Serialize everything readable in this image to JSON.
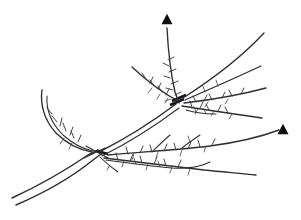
{
  "figure": {
    "title": "Thorny branch line drawing",
    "background_color": "#ffffff",
    "ink_color": "#2f2f33",
    "marker_color": "#0d0d10",
    "width": 301,
    "height": 220
  },
  "markers": [
    {
      "name": "upper-arrowhead",
      "label": "",
      "x": 167,
      "y": 19,
      "size": 11
    },
    {
      "name": "right-arrowhead",
      "label": "",
      "x": 283,
      "y": 129,
      "size": 11
    }
  ],
  "structure": {
    "trunk_label": "",
    "junction_label": "",
    "fan_node_label": ""
  },
  "annotations": []
}
